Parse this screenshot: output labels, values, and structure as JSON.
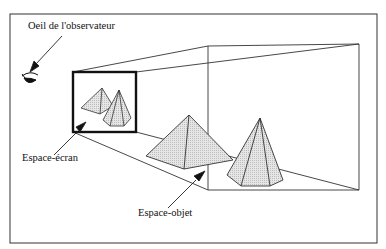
{
  "labels": {
    "eye": "Oeil de l'observateur",
    "screen_space": "Espace-écran",
    "object_space": "Espace-objet"
  },
  "icons": {
    "eye": "eye-icon"
  },
  "colors": {
    "line": "#222222",
    "fill": "#dcdcdc",
    "background": "#ffffff"
  }
}
